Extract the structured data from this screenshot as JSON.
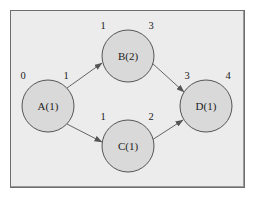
{
  "diagram": {
    "type": "activity-network",
    "colors": {
      "background": "#ececec",
      "node_fill": "#d9d9d9",
      "stroke": "#555555",
      "text": "#222222"
    },
    "nodes": [
      {
        "id": "A",
        "label": "A(1)",
        "cx": 48,
        "cy": 106,
        "r": 26,
        "start": "0",
        "end": "1"
      },
      {
        "id": "B",
        "label": "B(2)",
        "cx": 128,
        "cy": 56,
        "r": 26,
        "start": "1",
        "end": "3"
      },
      {
        "id": "C",
        "label": "C(1)",
        "cx": 128,
        "cy": 146,
        "r": 26,
        "start": "1",
        "end": "2"
      },
      {
        "id": "D",
        "label": "D(1)",
        "cx": 206,
        "cy": 106,
        "r": 26,
        "start": "3",
        "end": "4"
      }
    ],
    "edges": [
      {
        "from": "A",
        "to": "B"
      },
      {
        "from": "A",
        "to": "C"
      },
      {
        "from": "B",
        "to": "D"
      },
      {
        "from": "C",
        "to": "D"
      }
    ]
  }
}
